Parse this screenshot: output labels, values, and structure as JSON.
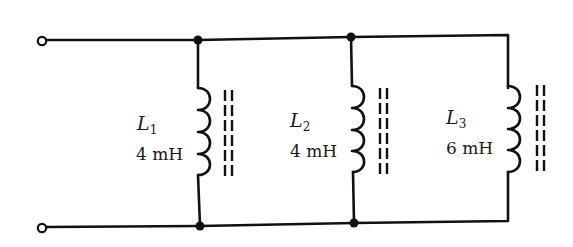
{
  "diagram": {
    "type": "parallel inductor circuit",
    "colors": {
      "wire": "#111111",
      "background": "#ffffff"
    },
    "terminals": [
      {
        "id": "top",
        "position": "top-left"
      },
      {
        "id": "bottom",
        "position": "bottom-left"
      }
    ],
    "inductors": [
      {
        "symbol": "L",
        "subscript": "1",
        "value": "4 mH",
        "core": "iron (dashed lines)"
      },
      {
        "symbol": "L",
        "subscript": "2",
        "value": "4 mH",
        "core": "iron (dashed lines)"
      },
      {
        "symbol": "L",
        "subscript": "3",
        "value": "6 mH",
        "core": "iron (dashed lines)"
      }
    ],
    "junctions": 4
  }
}
